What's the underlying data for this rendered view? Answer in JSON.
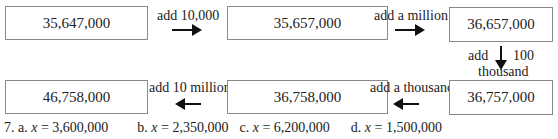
{
  "row1": {
    "box1": "35,647,000",
    "op1": "add 10,000",
    "box2": "35,657,000",
    "op2": "add a million",
    "box3": "36,657,000"
  },
  "down_op": {
    "left": "add",
    "right": "100",
    "bottom": "thousand"
  },
  "row2": {
    "box4": "36,757,000",
    "op3": "add a thousand",
    "box5": "36,758,000",
    "op4": "add 10 million",
    "box6": "46,758,000"
  },
  "answers": {
    "number": "7.",
    "a_label": "a.",
    "a_var": "x",
    "a_val": "= 3,600,000",
    "b_label": "b.",
    "b_var": "x",
    "b_val": "= 2,350,000",
    "c_label": "c.",
    "c_var": "x",
    "c_val": "= 6,200,000",
    "d_label": "d.",
    "d_var": "x",
    "d_val": "= 1,500,000"
  }
}
